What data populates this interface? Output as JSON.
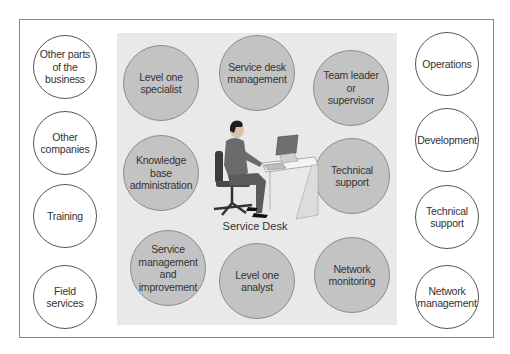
{
  "diagram": {
    "center_label": "Service Desk",
    "colors": {
      "panel_bg": "#e9e9e9",
      "role_circle_fill": "#c3c3c3",
      "external_circle_fill": "#ffffff",
      "frame_border": "#8a8a8a"
    },
    "left_externals": [
      {
        "label": "Other parts\nof the\nbusiness"
      },
      {
        "label": "Other\ncompanies"
      },
      {
        "label": "Training"
      },
      {
        "label": "Field\nservices"
      }
    ],
    "right_externals": [
      {
        "label": "Operations"
      },
      {
        "label": "Development"
      },
      {
        "label": "Technical\nsupport"
      },
      {
        "label": "Network\nmanagement"
      }
    ],
    "service_desk_roles": [
      {
        "label": "Level one\nspecialist"
      },
      {
        "label": "Service desk\nmanagement"
      },
      {
        "label": "Team leader\nor\nsupervisor"
      },
      {
        "label": "Knowledge\nbase\nadministration"
      },
      {
        "label": "Technical\nsupport"
      },
      {
        "label": "Service\nmanagement\nand\nimprovement"
      },
      {
        "label": "Level one\nanalyst"
      },
      {
        "label": "Network\nmonitoring"
      }
    ],
    "illustration": "person-at-computer-desk"
  }
}
